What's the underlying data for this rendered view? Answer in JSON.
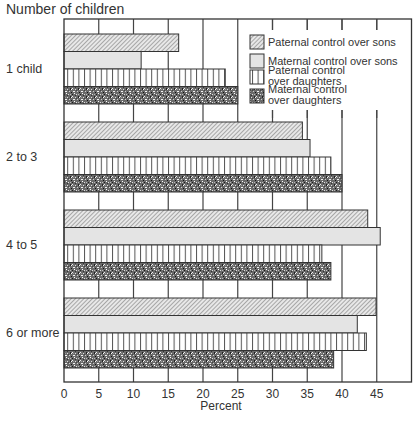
{
  "chart_data": {
    "type": "bar",
    "orientation": "horizontal",
    "title": "Number of children",
    "xlabel": "Percent",
    "ylabel": "Number of children",
    "categories": [
      "1 child",
      "2 to 3",
      "4 to 5",
      "6 or more"
    ],
    "series": [
      {
        "name": "Paternal control over sons",
        "pattern": "diagonal-hatch",
        "values": [
          16.5,
          34.3,
          43.7,
          44.9
        ]
      },
      {
        "name": "Maternal control over sons",
        "pattern": "light-gray",
        "values": [
          11.1,
          35.4,
          45.5,
          42.2
        ]
      },
      {
        "name": "Paternal control over daughters",
        "pattern": "vertical-lines",
        "values": [
          23.2,
          38.4,
          37.1,
          43.5
        ]
      },
      {
        "name": "Maternal control over daughters",
        "pattern": "dark-stipple",
        "values": [
          25.0,
          40.0,
          38.4,
          38.8
        ]
      }
    ],
    "xlim": [
      0,
      50
    ],
    "xticks": [
      0,
      5,
      10,
      15,
      20,
      25,
      30,
      35,
      40,
      45
    ],
    "grid": true,
    "legend_position": "upper right inside"
  },
  "legend": {
    "items": [
      [
        "Paternal control over sons"
      ],
      [
        "Maternal control over sons"
      ],
      [
        "Paternal control",
        "over daughters"
      ],
      [
        "Maternal control",
        "over daughters"
      ]
    ]
  }
}
